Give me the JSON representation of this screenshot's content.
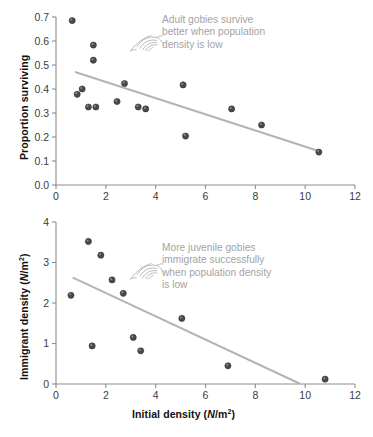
{
  "figure": {
    "background_color": "#ffffff",
    "marker_color": "#4a4a4e",
    "trend_line_color": "#b4b4b4",
    "axis_color": "#8d8d8d",
    "annotation_color": "#a3a3a3",
    "x_axis_title": "Initial density (N/m2)",
    "x_axis_title_main": "Initial density (",
    "x_axis_title_italic": "N",
    "x_axis_title_unit": "/m",
    "x_axis_title_exp": "2",
    "x_axis_title_close": ")"
  },
  "panels": [
    {
      "id": "top",
      "y_axis_title_main": "Proportion surviving",
      "annotation": "Adult gobies survive\nbetter when population\ndensity is low",
      "manicule_name": "pointing-hand-icon"
    },
    {
      "id": "bottom",
      "y_axis_title_main": "Immigrant density (",
      "y_axis_title_italic": "N",
      "y_axis_title_unit": "/m",
      "y_axis_title_exp": "2",
      "y_axis_title_close": ")",
      "annotation": "More juvenile gobies\nimmigrate successfully\nwhen population density\nis low",
      "manicule_name": "pointing-hand-icon"
    }
  ],
  "chart_data": [
    {
      "type": "scatter",
      "panel": "top",
      "title": "",
      "xlabel": "Initial density (N/m2)",
      "ylabel": "Proportion surviving",
      "xlim": [
        0,
        12
      ],
      "ylim": [
        0.0,
        0.7
      ],
      "xticks": [
        0,
        2,
        4,
        6,
        8,
        10,
        12
      ],
      "yticks": [
        0.0,
        0.1,
        0.2,
        0.3,
        0.4,
        0.5,
        0.6,
        0.7
      ],
      "xtick_labels": [
        "0",
        "2",
        "4",
        "6",
        "8",
        "10",
        "12"
      ],
      "ytick_labels": [
        "0.0",
        "0.1",
        "0.2",
        "0.3",
        "0.4",
        "0.5",
        "0.6",
        "0.7"
      ],
      "grid": false,
      "legend": false,
      "points": [
        {
          "x": 0.65,
          "y": 0.685
        },
        {
          "x": 0.85,
          "y": 0.378
        },
        {
          "x": 1.05,
          "y": 0.4
        },
        {
          "x": 1.3,
          "y": 0.325
        },
        {
          "x": 1.5,
          "y": 0.583
        },
        {
          "x": 1.5,
          "y": 0.52
        },
        {
          "x": 1.6,
          "y": 0.325
        },
        {
          "x": 2.45,
          "y": 0.348
        },
        {
          "x": 2.75,
          "y": 0.423
        },
        {
          "x": 3.3,
          "y": 0.325
        },
        {
          "x": 3.6,
          "y": 0.317
        },
        {
          "x": 5.1,
          "y": 0.417
        },
        {
          "x": 5.2,
          "y": 0.204
        },
        {
          "x": 7.05,
          "y": 0.317
        },
        {
          "x": 8.25,
          "y": 0.25
        },
        {
          "x": 10.55,
          "y": 0.137
        }
      ],
      "trend_line": {
        "x1": 0.8,
        "y1": 0.47,
        "x2": 10.6,
        "y2": 0.14
      }
    },
    {
      "type": "scatter",
      "panel": "bottom",
      "title": "",
      "xlabel": "Initial density (N/m2)",
      "ylabel": "Immigrant density (N/m2)",
      "xlim": [
        0,
        12
      ],
      "ylim": [
        0,
        4
      ],
      "xticks": [
        0,
        2,
        4,
        6,
        8,
        10,
        12
      ],
      "yticks": [
        0,
        1,
        2,
        3,
        4
      ],
      "xtick_labels": [
        "0",
        "2",
        "4",
        "6",
        "8",
        "10",
        "12"
      ],
      "ytick_labels": [
        "0",
        "1",
        "2",
        "3",
        "4"
      ],
      "grid": false,
      "legend": false,
      "points": [
        {
          "x": 0.6,
          "y": 2.19
        },
        {
          "x": 1.3,
          "y": 3.52
        },
        {
          "x": 1.45,
          "y": 0.94
        },
        {
          "x": 1.8,
          "y": 3.18
        },
        {
          "x": 2.25,
          "y": 2.57
        },
        {
          "x": 2.7,
          "y": 2.24
        },
        {
          "x": 3.1,
          "y": 1.15
        },
        {
          "x": 3.4,
          "y": 0.82
        },
        {
          "x": 5.05,
          "y": 1.62
        },
        {
          "x": 6.9,
          "y": 0.45
        },
        {
          "x": 10.8,
          "y": 0.12
        }
      ],
      "trend_line": {
        "x1": 0.7,
        "y1": 2.62,
        "x2": 9.75,
        "y2": 0.02
      }
    }
  ]
}
